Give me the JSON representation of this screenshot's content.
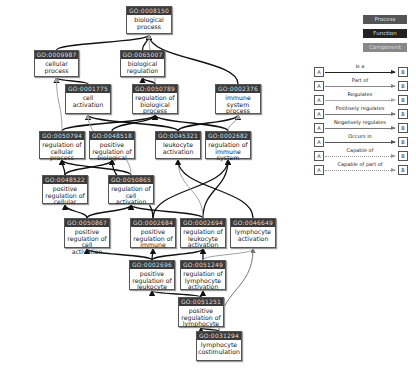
{
  "diagram": {
    "nodes": [
      {
        "id": "GO:0008150",
        "label": "biological process",
        "x": 126,
        "y": 6,
        "w": 46,
        "h": 28
      },
      {
        "id": "GO:0009987",
        "label": "cellular process",
        "x": 34,
        "y": 50,
        "w": 45,
        "h": 27
      },
      {
        "id": "GO:0065007",
        "label": "biological regulation",
        "x": 120,
        "y": 50,
        "w": 45,
        "h": 27
      },
      {
        "id": "GO:0001775",
        "label": "cell activation",
        "x": 65,
        "y": 84,
        "w": 46,
        "h": 30
      },
      {
        "id": "GO:0050789",
        "label": "regulation of biological process",
        "x": 132,
        "y": 84,
        "w": 46,
        "h": 30
      },
      {
        "id": "GO:0002376",
        "label": "immune system process",
        "x": 215,
        "y": 84,
        "w": 46,
        "h": 30
      },
      {
        "id": "GO:0050794",
        "label": "regulation of cellular process",
        "x": 39,
        "y": 131,
        "w": 46,
        "h": 28
      },
      {
        "id": "GO:0048518",
        "label": "positive regulation of biological",
        "x": 89,
        "y": 131,
        "w": 46,
        "h": 28
      },
      {
        "id": "GO:0045321",
        "label": "leukocyte activation",
        "x": 155,
        "y": 131,
        "w": 46,
        "h": 28
      },
      {
        "id": "GO:0002682",
        "label": "regulation of immune system",
        "x": 205,
        "y": 131,
        "w": 46,
        "h": 28
      },
      {
        "id": "GO:0048522",
        "label": "positive regulation of cellular",
        "x": 42,
        "y": 175,
        "w": 46,
        "h": 29
      },
      {
        "id": "GO:0050865",
        "label": "regulation of cell activation",
        "x": 108,
        "y": 175,
        "w": 46,
        "h": 29
      },
      {
        "id": "GO:0050867",
        "label": "positive regulation of cell activation",
        "x": 64,
        "y": 218,
        "w": 46,
        "h": 30
      },
      {
        "id": "GO:0002684",
        "label": "positive regulation of immune",
        "x": 130,
        "y": 218,
        "w": 46,
        "h": 30
      },
      {
        "id": "GO:0002694",
        "label": "regulation of leukocyte activation",
        "x": 180,
        "y": 218,
        "w": 46,
        "h": 30
      },
      {
        "id": "GO:0046649",
        "label": "lymphocyte activation",
        "x": 230,
        "y": 218,
        "w": 46,
        "h": 30
      },
      {
        "id": "GO:0002696",
        "label": "positive regulation of leukocyte",
        "x": 129,
        "y": 260,
        "w": 46,
        "h": 30
      },
      {
        "id": "GO:0051249",
        "label": "regulation of lymphocyte activation",
        "x": 180,
        "y": 260,
        "w": 46,
        "h": 30
      },
      {
        "id": "GO:0051251",
        "label": "positive regulation of lymphocyte",
        "x": 178,
        "y": 297,
        "w": 46,
        "h": 30
      },
      {
        "id": "GO:0031294",
        "label": "lymphocyte costimulation",
        "x": 196,
        "y": 331,
        "w": 46,
        "h": 30
      }
    ],
    "edges": [
      {
        "from": "GO:0009987",
        "to": "GO:0008150",
        "type": "is_a"
      },
      {
        "from": "GO:0065007",
        "to": "GO:0008150",
        "type": "is_a"
      },
      {
        "from": "GO:0002376",
        "to": "GO:0008150",
        "type": "is_a"
      },
      {
        "from": "GO:0050789",
        "to": "GO:0008150",
        "type": "regulates"
      },
      {
        "from": "GO:0050789",
        "to": "GO:0065007",
        "type": "is_a"
      },
      {
        "from": "GO:0001775",
        "to": "GO:0009987",
        "type": "is_a"
      },
      {
        "from": "GO:0050794",
        "to": "GO:0050789",
        "type": "is_a"
      },
      {
        "from": "GO:0048518",
        "to": "GO:0050789",
        "type": "is_a"
      },
      {
        "from": "GO:0050794",
        "to": "GO:0009987",
        "type": "regulates"
      },
      {
        "from": "GO:0045321",
        "to": "GO:0001775",
        "type": "is_a"
      },
      {
        "from": "GO:0045321",
        "to": "GO:0002376",
        "type": "is_a"
      },
      {
        "from": "GO:0002682",
        "to": "GO:0050789",
        "type": "is_a"
      },
      {
        "from": "GO:0002682",
        "to": "GO:0002376",
        "type": "regulates"
      },
      {
        "from": "GO:0048522",
        "to": "GO:0050794",
        "type": "is_a"
      },
      {
        "from": "GO:0048522",
        "to": "GO:0048518",
        "type": "is_a"
      },
      {
        "from": "GO:0050865",
        "to": "GO:0050794",
        "type": "is_a"
      },
      {
        "from": "GO:0050865",
        "to": "GO:0001775",
        "type": "regulates"
      },
      {
        "from": "GO:0050867",
        "to": "GO:0048522",
        "type": "is_a"
      },
      {
        "from": "GO:0050867",
        "to": "GO:0050865",
        "type": "is_a"
      },
      {
        "from": "GO:0002684",
        "to": "GO:0048518",
        "type": "is_a"
      },
      {
        "from": "GO:0002684",
        "to": "GO:0002682",
        "type": "is_a"
      },
      {
        "from": "GO:0002694",
        "to": "GO:0050865",
        "type": "is_a"
      },
      {
        "from": "GO:0002694",
        "to": "GO:0002682",
        "type": "is_a"
      },
      {
        "from": "GO:0002694",
        "to": "GO:0045321",
        "type": "regulates"
      },
      {
        "from": "GO:0046649",
        "to": "GO:0045321",
        "type": "is_a"
      },
      {
        "from": "GO:0002696",
        "to": "GO:0050867",
        "type": "is_a"
      },
      {
        "from": "GO:0002696",
        "to": "GO:0002684",
        "type": "is_a"
      },
      {
        "from": "GO:0002696",
        "to": "GO:0002694",
        "type": "is_a"
      },
      {
        "from": "GO:0051249",
        "to": "GO:0002694",
        "type": "is_a"
      },
      {
        "from": "GO:0051249",
        "to": "GO:0046649",
        "type": "regulates"
      },
      {
        "from": "GO:0051251",
        "to": "GO:0002696",
        "type": "is_a"
      },
      {
        "from": "GO:0051251",
        "to": "GO:0051249",
        "type": "is_a"
      },
      {
        "from": "GO:0031294",
        "to": "GO:0051251",
        "type": "is_a"
      },
      {
        "from": "GO:0031294",
        "to": "GO:0046649",
        "type": "part_of"
      }
    ]
  },
  "legend": {
    "categories": [
      {
        "label": "Process",
        "color": "#555555"
      },
      {
        "label": "Function",
        "color": "#222222"
      },
      {
        "label": "Component",
        "color": "#888888"
      }
    ],
    "relations": [
      {
        "label": "Is a",
        "color": "#222222",
        "dash": false,
        "width": 1.6
      },
      {
        "label": "Part of",
        "color": "#888888",
        "dash": false,
        "width": 1
      },
      {
        "label": "Regulates",
        "color": "#aaaaaa",
        "dash": false,
        "width": 1
      },
      {
        "label": "Positively regulates",
        "color": "#777777",
        "dash": false,
        "width": 1
      },
      {
        "label": "Negatively regulates",
        "color": "#777777",
        "dash": false,
        "width": 1
      },
      {
        "label": "Occurs in",
        "color": "#555555",
        "dash": false,
        "width": 1
      },
      {
        "label": "Capable of",
        "color": "#999999",
        "dash": true,
        "width": 1
      },
      {
        "label": "Capable of part of",
        "color": "#999999",
        "dash": true,
        "width": 1
      }
    ],
    "box_a": "A",
    "box_b": "B"
  },
  "edge_colors": {
    "is_a": "#111111",
    "regulates": "#a0a0a0",
    "part_of": "#777777"
  }
}
